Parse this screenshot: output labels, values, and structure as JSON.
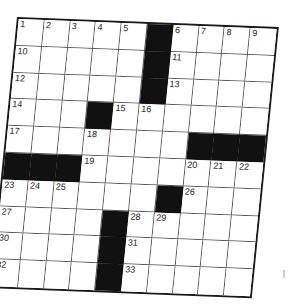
{
  "puzzle": {
    "type": "crossword",
    "rows": 10,
    "cols": 10,
    "colors": {
      "black_square": "#111111",
      "white_square": "#ffffff",
      "grid_line": "#555555",
      "border": "#1a1a1a"
    },
    "grid": [
      [
        "1",
        "2",
        "3",
        "4",
        "5",
        "#",
        "6",
        "7",
        "8",
        "9"
      ],
      [
        "10",
        "",
        "",
        "",
        "",
        "#",
        "11",
        "",
        "",
        ""
      ],
      [
        "12",
        "",
        "",
        "",
        "",
        "#",
        "13",
        "",
        "",
        ""
      ],
      [
        "14",
        "",
        "",
        "#",
        "15",
        "16",
        "",
        "",
        "",
        ""
      ],
      [
        "17",
        "",
        "",
        "18",
        "",
        "",
        "",
        "#",
        "#",
        "#"
      ],
      [
        "#",
        "#",
        "#",
        "19",
        "",
        "",
        "",
        "20",
        "21",
        "22"
      ],
      [
        "23",
        "24",
        "25",
        "",
        "",
        "",
        "#",
        "26",
        "",
        ""
      ],
      [
        "27",
        "",
        "",
        "",
        "#",
        "28",
        "29",
        "",
        "",
        ""
      ],
      [
        "30",
        "",
        "",
        "",
        "#",
        "31",
        "",
        "",
        "",
        ""
      ],
      [
        "32",
        "",
        "",
        "",
        "#",
        "33",
        "",
        "",
        "",
        ""
      ]
    ],
    "clue_numbers": [
      "1",
      "2",
      "3",
      "4",
      "5",
      "6",
      "7",
      "8",
      "9",
      "10",
      "11",
      "12",
      "13",
      "14",
      "15",
      "16",
      "17",
      "18",
      "19",
      "20",
      "21",
      "22",
      "23",
      "24",
      "25",
      "26",
      "27",
      "28",
      "29",
      "30",
      "31",
      "32",
      "33"
    ]
  }
}
